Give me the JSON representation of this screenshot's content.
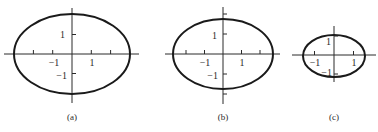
{
  "figure": {
    "panels": [
      {
        "id": "a",
        "caption": "(a)",
        "ellipse": {
          "semi_x": 3,
          "semi_y": 2
        },
        "x_tick_positions": [
          -2,
          -1,
          1,
          2
        ],
        "y_tick_positions": [
          -1,
          1
        ],
        "x_tick_labels": [
          {
            "value": -1,
            "text": "−1"
          },
          {
            "value": 1,
            "text": "1"
          }
        ],
        "y_tick_labels": [
          {
            "value": 1,
            "text": "1"
          },
          {
            "value": -1,
            "text": "−1"
          }
        ]
      },
      {
        "id": "b",
        "caption": "(b)",
        "ellipse": {
          "semi_x": 2.6,
          "semi_y": 1.8
        },
        "x_tick_positions": [
          -2,
          -1,
          1,
          2
        ],
        "y_tick_positions": [
          -2,
          -1,
          1,
          2
        ],
        "x_tick_labels": [
          {
            "value": -1,
            "text": "−1"
          },
          {
            "value": 1,
            "text": "1"
          }
        ],
        "y_tick_labels": [
          {
            "value": 1,
            "text": "1"
          },
          {
            "value": -1,
            "text": "−1"
          }
        ]
      },
      {
        "id": "c",
        "caption": "(c)",
        "ellipse": {
          "semi_x": 1.6,
          "semi_y": 1.1
        },
        "x_tick_positions": [
          -1,
          1
        ],
        "y_tick_positions": [
          -1,
          1
        ],
        "x_tick_labels": [
          {
            "value": -1,
            "text": "−1"
          },
          {
            "value": 1,
            "text": "1"
          }
        ],
        "y_tick_labels": [
          {
            "value": 1,
            "text": "1"
          },
          {
            "value": -1,
            "text": "−1"
          }
        ]
      }
    ]
  }
}
